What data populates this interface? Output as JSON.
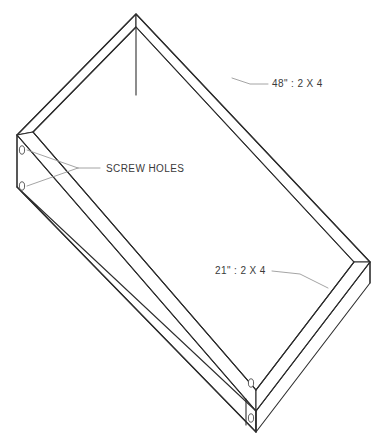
{
  "drawing": {
    "type": "isometric-technical-drawing",
    "subject": "open rectangular box frame built from 2 X 4 lumber",
    "background_color": "#ffffff",
    "line_color": "#2e2e2e",
    "leader_line_color": "#9a9a9a",
    "text_color": "#3a3a3a",
    "hole_stroke_color": "#4a4a4a",
    "annotations": [
      {
        "id": "long-side-dimension",
        "name": "long-side-label",
        "text": "48\" : 2 X 4",
        "text_x": 272,
        "text_y": 87,
        "leader": "M 232,78 L 250,84 L 268,84"
      },
      {
        "id": "short-side-dimension",
        "name": "short-side-label",
        "text": "21\" : 2 X 4",
        "text_x": 215,
        "text_y": 274,
        "leader": "M 272,271 L 300,274 L 328,288"
      },
      {
        "id": "screw-holes-callout",
        "name": "screw-holes-label",
        "text": "SCREW HOLES",
        "text_x": 106,
        "text_y": 172,
        "leader_main": "M 100,168 L 78,168",
        "leader_branch_a": "M 78,168 L 27,150",
        "leader_branch_b": "M 78,168 L 27,186"
      }
    ],
    "screw_holes": [
      {
        "name": "screw-hole-left-upper",
        "cx": 22,
        "cy": 150,
        "rx": 2.6,
        "ry": 4.2
      },
      {
        "name": "screw-hole-left-lower",
        "cx": 22,
        "cy": 186,
        "rx": 2.6,
        "ry": 4.2
      },
      {
        "name": "screw-hole-front-upper",
        "cx": 251,
        "cy": 383,
        "rx": 2.6,
        "ry": 4.2
      },
      {
        "name": "screw-hole-front-lower",
        "cx": 251,
        "cy": 418,
        "rx": 2.6,
        "ry": 4.2
      }
    ],
    "geometry": {
      "outer_top_rim": "M 136,14 L 17,135 L 256,411 L 370,262 Z",
      "inner_top_rim": "M 136,27 L 33,132 L 256,390 L 354,262 Z",
      "far_left_board_top": "M 136,14 L 17,135 L 33,132 L 136,27 Z",
      "far_right_board_top": "M 136,14 L 370,262 L 354,262 L 136,27 Z",
      "near_left_board_top": "M 17,135 L 256,411 L 256,390 L 33,132 Z",
      "near_right_board_top": "M 370,262 L 256,411 L 256,390 L 354,262 Z",
      "inner_corner_vertical": "M 136,27 L 136,95",
      "left_end_outer_face": "M 17,135 L 17,187 L 256,432 L 256,411 Z",
      "left_end_edge_vertical": "M 17,135 L 17,187",
      "near_left_outer_face": "M 17,187 L 256,432 L 256,411 Z",
      "near_right_outer_face": "M 256,411 L 256,432 L 370,283 L 370,262 Z",
      "right_end_edge_vertical": "M 370,262 L 370,283",
      "front_corner_vertical": "M 256,411 L 256,432",
      "front_corner_inner_vertical": "M 246,399 L 246,425",
      "inner_wall_left": "M 33,132 L 256,390",
      "inner_wall_right": "M 354,262 L 256,390"
    }
  }
}
